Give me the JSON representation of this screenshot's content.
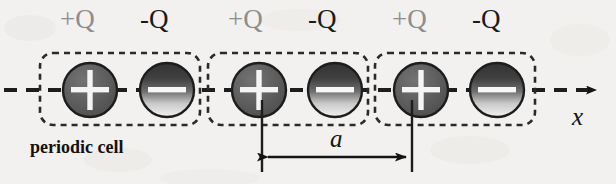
{
  "figure": {
    "background_color": "#f2f1ef",
    "axis_label": "x",
    "lattice_constant_label": "a",
    "cell_label": "periodic cell",
    "charge_positive_label": "+Q",
    "charge_negative_label": "-Q",
    "colors": {
      "positive_fill": "#5e5e5e",
      "negative_fill_top": "#3b3b3b",
      "negative_fill_bottom": "#ededed",
      "outline": "#1d1d1d",
      "sign_glyph": "#ffffff",
      "positive_label_text": "#8d8d8d",
      "negative_label_text": "#1b1b1b",
      "dashed_line": "#1d1d1d",
      "cell_box_stroke": "#2a2a2a"
    }
  },
  "charge_labels": [
    {
      "text": "+Q",
      "sign": "positive",
      "x": 60,
      "y": 6
    },
    {
      "text": "-Q",
      "sign": "negative",
      "x": 140,
      "y": 6
    },
    {
      "text": "+Q",
      "sign": "positive",
      "x": 228,
      "y": 6
    },
    {
      "text": "-Q",
      "sign": "negative",
      "x": 308,
      "y": 6
    },
    {
      "text": "+Q",
      "sign": "positive",
      "x": 392,
      "y": 6
    },
    {
      "text": "-Q",
      "sign": "negative",
      "x": 472,
      "y": 6
    }
  ],
  "charges": [
    {
      "sign": "positive",
      "cx": 90,
      "cy": 90,
      "r": 27
    },
    {
      "sign": "negative",
      "cx": 167,
      "cy": 90,
      "r": 27
    },
    {
      "sign": "positive",
      "cx": 259,
      "cy": 90,
      "r": 27
    },
    {
      "sign": "negative",
      "cx": 335,
      "cy": 90,
      "r": 27
    },
    {
      "sign": "positive",
      "cx": 421,
      "cy": 90,
      "r": 27
    },
    {
      "sign": "negative",
      "cx": 497,
      "cy": 90,
      "r": 27
    }
  ],
  "periodic_cells": [
    {
      "x": 40,
      "y": 53,
      "width": 160,
      "height": 72
    },
    {
      "x": 208,
      "y": 53,
      "width": 160,
      "height": 72
    },
    {
      "x": 375,
      "y": 53,
      "width": 160,
      "height": 72
    }
  ],
  "axis": {
    "y": 90,
    "x_start": 4,
    "x_end": 600,
    "arrow": true,
    "label": "x",
    "label_x": 572,
    "label_y": 104
  },
  "dimension": {
    "label": "a",
    "label_x": 330,
    "label_y": 126,
    "line_y": 157,
    "x_left": 262,
    "x_right": 412,
    "tick_top": 100,
    "tick_bottom": 172
  },
  "cell_annotation": {
    "text": "periodic cell",
    "x": 30,
    "y": 138
  }
}
